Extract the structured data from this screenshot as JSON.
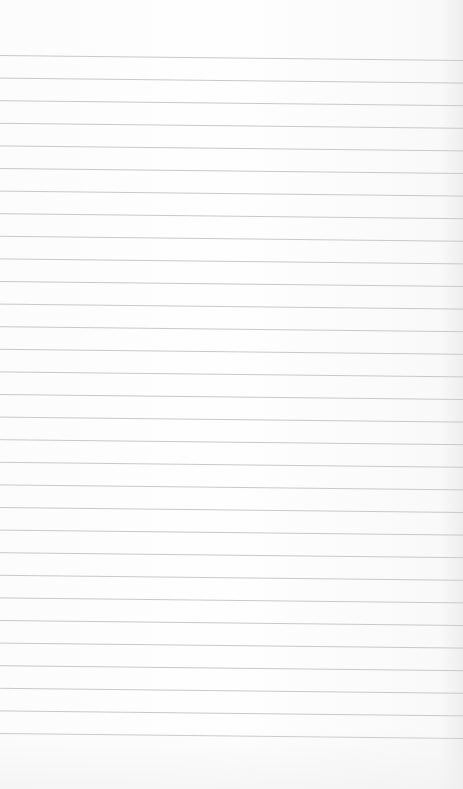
{
  "document": {
    "type": "lined-paper",
    "content_text": "",
    "rules": {
      "count": 31,
      "first_y_left": 55.5,
      "spacing": 22.6,
      "slope_px_across_width": 5,
      "color": "#c9c9c9",
      "background": "#fdfdfd"
    }
  }
}
